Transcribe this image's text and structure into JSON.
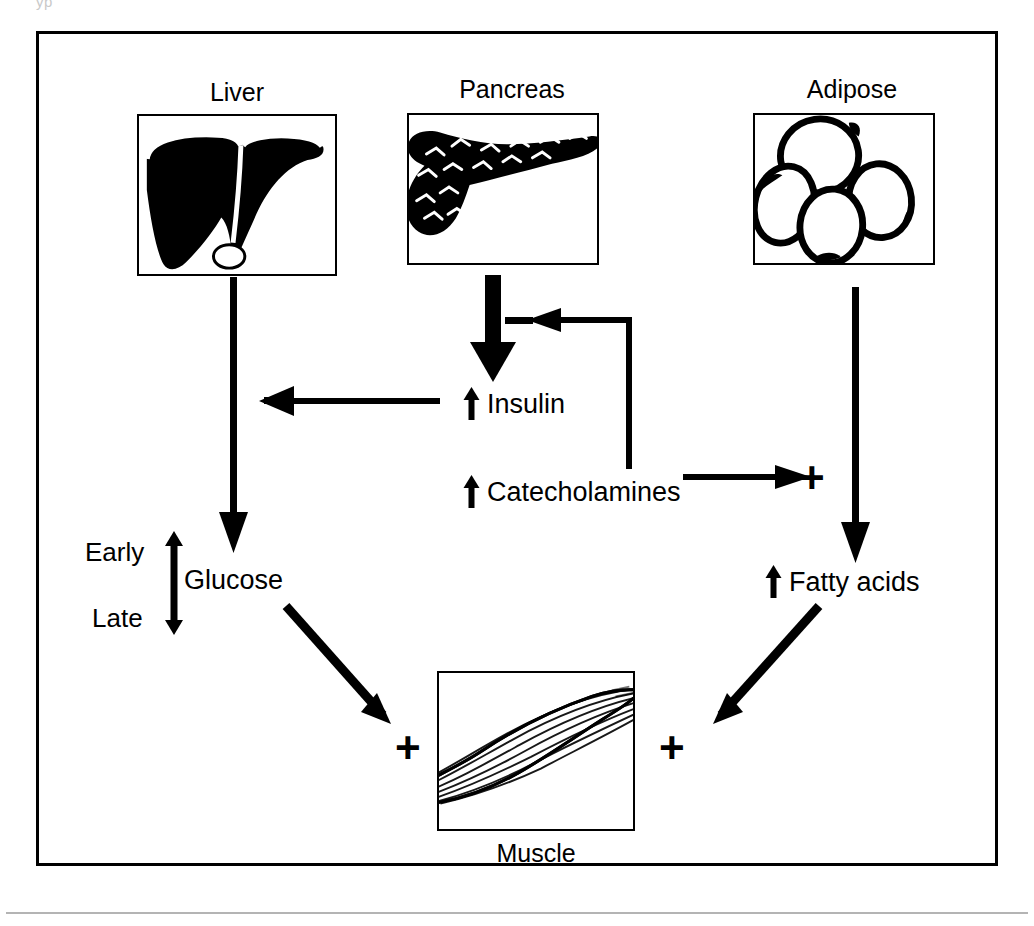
{
  "figure": {
    "top_remnant_text": "yp",
    "frame_color": "#000000",
    "background_color": "#ffffff"
  },
  "organs": [
    {
      "id": "liver",
      "label": "Liver",
      "label_position": "above",
      "art": "liver-silhouette"
    },
    {
      "id": "pancreas",
      "label": "Pancreas",
      "label_position": "above",
      "art": "pancreas-silhouette"
    },
    {
      "id": "adipose",
      "label": "Adipose",
      "label_position": "above",
      "art": "adipose-cells"
    },
    {
      "id": "muscle",
      "label": "Muscle",
      "label_position": "below",
      "art": "muscle-striated"
    }
  ],
  "nodes": [
    {
      "id": "insulin",
      "arrow": "up",
      "label": "Insulin"
    },
    {
      "id": "catecholamines",
      "arrow": "up",
      "label": "Catecholamines"
    },
    {
      "id": "glucose",
      "arrow": "none",
      "label": "Glucose"
    },
    {
      "id": "fatty-acids",
      "arrow": "up",
      "label": "Fatty acids"
    }
  ],
  "sidenotes": [
    {
      "id": "early",
      "label": "Early",
      "arrow": "up"
    },
    {
      "id": "late",
      "label": "Late",
      "arrow": "down"
    }
  ],
  "signs": [
    {
      "id": "minus-liver",
      "symbol": "−",
      "target": "liver-output-arrow"
    },
    {
      "id": "minus-pancreas",
      "symbol": "−",
      "target": "pancreas-output-arrow"
    },
    {
      "id": "plus-adipose",
      "symbol": "+",
      "target": "adipose-output-arrow"
    },
    {
      "id": "plus-muscle-left",
      "symbol": "+",
      "target": "muscle-glucose-uptake"
    },
    {
      "id": "plus-muscle-right",
      "symbol": "+",
      "target": "muscle-fatty-acid-uptake"
    }
  ],
  "connections": [
    {
      "id": "liver-to-glucose",
      "from": "liver",
      "to": "glucose",
      "kind": "arrow-down",
      "weight": "thin"
    },
    {
      "id": "pancreas-to-insulin",
      "from": "pancreas",
      "to": "insulin",
      "kind": "arrow-down",
      "weight": "thick"
    },
    {
      "id": "adipose-to-fatty-acids",
      "from": "adipose",
      "to": "fatty-acids",
      "kind": "arrow-down",
      "weight": "thin"
    },
    {
      "id": "insulin-inhibits-liver",
      "from": "insulin",
      "to": "liver-output-arrow",
      "kind": "arrow-left",
      "sign": "−"
    },
    {
      "id": "catecholamines-inhibit-insulin",
      "from": "catecholamines",
      "to": "pancreas-output-arrow",
      "kind": "elbow-up-left",
      "sign": "−"
    },
    {
      "id": "catecholamines-stimulate-adipose",
      "from": "catecholamines",
      "to": "adipose-output-arrow",
      "kind": "arrow-right",
      "sign": "+"
    },
    {
      "id": "glucose-to-muscle",
      "from": "glucose",
      "to": "muscle",
      "kind": "arrow-diagonal-down-right",
      "sign": "+"
    },
    {
      "id": "fatty-acids-to-muscle",
      "from": "fatty-acids",
      "to": "muscle",
      "kind": "arrow-diagonal-down-left",
      "sign": "+"
    }
  ]
}
